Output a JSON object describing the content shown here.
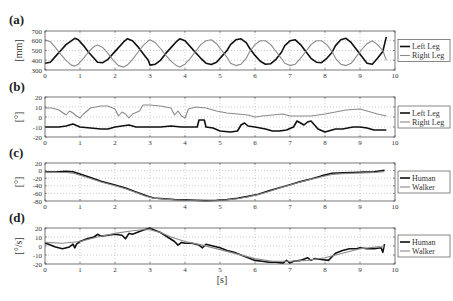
{
  "chart_data": [
    {
      "type": "line",
      "panel_label": "(a)",
      "ylabel": "[mm]",
      "xlabel": "",
      "xlim": [
        0,
        10
      ],
      "ylim": [
        300,
        700
      ],
      "xticks": [
        "0",
        "1",
        "2",
        "3",
        "4",
        "5",
        "6",
        "7",
        "8",
        "9",
        "10"
      ],
      "yticks": [
        "300",
        "400",
        "500",
        "600",
        "700"
      ],
      "ytick_values": [
        300,
        400,
        500,
        600,
        700
      ],
      "grid": true,
      "legend_position": "right",
      "series": [
        {
          "name": "Left Leg",
          "color": "#111111",
          "x": [
            0,
            0.15,
            0.3,
            0.45,
            0.6,
            0.75,
            0.85,
            0.95,
            1.1,
            1.25,
            1.4,
            1.5,
            1.65,
            1.8,
            1.95,
            2.1,
            2.25,
            2.35,
            2.5,
            2.65,
            2.8,
            2.95,
            3.0,
            3.15,
            3.3,
            3.45,
            3.6,
            3.75,
            3.85,
            4.0,
            4.15,
            4.3,
            4.45,
            4.6,
            4.75,
            4.9,
            5.05,
            5.2,
            5.3,
            5.45,
            5.6,
            5.75,
            5.85,
            6.0,
            6.15,
            6.3,
            6.45,
            6.6,
            6.75,
            6.85,
            7.0,
            7.15,
            7.3,
            7.45,
            7.6,
            7.75,
            7.9,
            8.05,
            8.2,
            8.3,
            8.45,
            8.6,
            8.75,
            8.9,
            9.05,
            9.2,
            9.35,
            9.5,
            9.65,
            9.75
          ],
          "y": [
            370,
            380,
            440,
            500,
            560,
            600,
            625,
            610,
            550,
            480,
            420,
            380,
            375,
            410,
            470,
            530,
            590,
            620,
            600,
            540,
            470,
            400,
            350,
            360,
            400,
            470,
            530,
            590,
            620,
            600,
            540,
            480,
            420,
            370,
            355,
            380,
            440,
            500,
            560,
            610,
            620,
            580,
            520,
            450,
            390,
            360,
            365,
            410,
            480,
            550,
            600,
            610,
            560,
            490,
            420,
            380,
            375,
            420,
            480,
            550,
            610,
            625,
            580,
            510,
            440,
            370,
            360,
            420,
            490,
            640
          ]
        },
        {
          "name": "Right Leg",
          "color": "#8a8a8a",
          "x": [
            0,
            0.15,
            0.3,
            0.45,
            0.6,
            0.75,
            0.85,
            0.95,
            1.1,
            1.25,
            1.4,
            1.5,
            1.65,
            1.8,
            1.95,
            2.1,
            2.25,
            2.35,
            2.5,
            2.65,
            2.8,
            2.95,
            3.0,
            3.15,
            3.3,
            3.45,
            3.6,
            3.75,
            3.85,
            4.0,
            4.15,
            4.3,
            4.45,
            4.6,
            4.75,
            4.9,
            5.05,
            5.2,
            5.3,
            5.45,
            5.6,
            5.75,
            5.85,
            6.0,
            6.15,
            6.3,
            6.45,
            6.6,
            6.75,
            6.85,
            7.0,
            7.15,
            7.3,
            7.45,
            7.6,
            7.75,
            7.9,
            8.05,
            8.2,
            8.3,
            8.45,
            8.6,
            8.75,
            8.9,
            9.05,
            9.2,
            9.35,
            9.5,
            9.65,
            9.75
          ],
          "y": [
            610,
            590,
            530,
            460,
            400,
            350,
            340,
            360,
            420,
            490,
            540,
            555,
            530,
            470,
            400,
            345,
            330,
            350,
            410,
            480,
            550,
            600,
            610,
            580,
            520,
            450,
            390,
            345,
            330,
            360,
            420,
            490,
            560,
            600,
            610,
            570,
            500,
            430,
            370,
            345,
            360,
            420,
            490,
            560,
            600,
            600,
            560,
            490,
            420,
            370,
            345,
            360,
            420,
            490,
            560,
            600,
            600,
            560,
            490,
            420,
            360,
            345,
            370,
            440,
            510,
            570,
            600,
            560,
            500,
            400
          ]
        }
      ]
    },
    {
      "type": "line",
      "panel_label": "(b)",
      "ylabel": "[°]",
      "xlabel": "",
      "xlim": [
        0,
        10
      ],
      "ylim": [
        -20,
        20
      ],
      "xticks": [
        "0",
        "1",
        "2",
        "3",
        "4",
        "5",
        "6",
        "7",
        "8",
        "9",
        "10"
      ],
      "yticks": [
        "-20",
        "-10",
        "0",
        "10",
        "20"
      ],
      "ytick_values": [
        -20,
        -10,
        0,
        10,
        20
      ],
      "grid": true,
      "legend_position": "right",
      "series": [
        {
          "name": "Left Leg",
          "color": "#111111",
          "x": [
            0,
            0.4,
            0.6,
            0.8,
            1.0,
            1.3,
            1.6,
            1.8,
            2.0,
            2.2,
            2.4,
            2.6,
            2.8,
            3.0,
            3.3,
            3.6,
            3.9,
            4.2,
            4.35,
            4.4,
            4.55,
            4.6,
            4.8,
            5.0,
            5.3,
            5.5,
            5.6,
            5.7,
            5.8,
            6.0,
            6.3,
            6.5,
            6.7,
            6.9,
            7.1,
            7.2,
            7.3,
            7.4,
            7.5,
            7.6,
            7.7,
            7.8,
            8.0,
            8.1,
            8.3,
            8.5,
            8.8,
            9.0,
            9.2,
            9.4,
            9.6,
            9.75
          ],
          "y": [
            -10,
            -10,
            -9,
            -7,
            -10,
            -11,
            -12,
            -12,
            -10,
            -9,
            -8,
            -10,
            -10,
            -10,
            -10,
            -9,
            -10,
            -10,
            -10,
            -3,
            -3,
            -10,
            -11,
            -14,
            -15,
            -14,
            -8,
            -6,
            -9,
            -10,
            -12,
            -14,
            -14,
            -13,
            -10,
            -4,
            -6,
            -8,
            -5,
            -4,
            -8,
            -12,
            -15,
            -14,
            -12,
            -12,
            -10,
            -10,
            -11,
            -13,
            -13,
            -13
          ]
        },
        {
          "name": "Right Leg",
          "color": "#8a8a8a",
          "x": [
            0,
            0.2,
            0.4,
            0.6,
            0.7,
            0.8,
            0.9,
            1.0,
            1.1,
            1.3,
            1.6,
            1.8,
            2.0,
            2.1,
            2.2,
            2.3,
            2.4,
            2.5,
            2.7,
            2.8,
            3.0,
            3.3,
            3.6,
            3.7,
            3.8,
            3.9,
            4.0,
            4.1,
            4.3,
            4.6,
            4.9,
            5.2,
            5.5,
            5.8,
            6.0,
            6.2,
            6.5,
            6.8,
            7.0,
            7.3,
            7.6,
            8.0,
            8.3,
            8.6,
            9.0,
            9.2,
            9.5,
            9.75
          ],
          "y": [
            9,
            9,
            7,
            2,
            6,
            4,
            1,
            -1,
            3,
            9,
            11,
            11,
            8,
            1,
            5,
            3,
            -1,
            3,
            6,
            12,
            12,
            11,
            9,
            2,
            6,
            1,
            -1,
            8,
            10,
            9,
            6,
            4,
            3,
            2,
            0,
            1,
            2,
            3,
            1,
            1,
            1,
            3,
            5,
            7,
            8,
            6,
            3,
            1
          ]
        }
      ]
    },
    {
      "type": "line",
      "panel_label": "(c)",
      "ylabel": "[°]",
      "xlabel": "",
      "xlim": [
        0,
        10
      ],
      "ylim": [
        -80,
        20
      ],
      "xticks": [
        "0",
        "1",
        "2",
        "3",
        "4",
        "5",
        "6",
        "7",
        "8",
        "9",
        "10"
      ],
      "yticks": [
        "-80",
        "-60",
        "-40",
        "-20",
        "0",
        "20"
      ],
      "ytick_values": [
        -80,
        -60,
        -40,
        -20,
        0,
        20
      ],
      "grid": true,
      "legend_position": "right",
      "series": [
        {
          "name": "Human",
          "color": "#111111",
          "x": [
            0,
            0.3,
            0.6,
            0.8,
            1.0,
            1.3,
            1.6,
            2.0,
            2.3,
            2.6,
            2.9,
            3.1,
            3.4,
            3.7,
            4.0,
            4.3,
            4.6,
            4.9,
            5.2,
            5.5,
            5.8,
            6.1,
            6.4,
            6.7,
            7.0,
            7.3,
            7.6,
            7.9,
            8.2,
            8.5,
            8.8,
            9.1,
            9.4,
            9.7
          ],
          "y": [
            -3,
            -4,
            -2,
            -3,
            -9,
            -18,
            -28,
            -38,
            -46,
            -56,
            -66,
            -72,
            -74,
            -76,
            -77,
            -78,
            -79,
            -78,
            -76,
            -73,
            -68,
            -62,
            -53,
            -45,
            -37,
            -29,
            -22,
            -14,
            -7,
            -6,
            -5,
            -4,
            -3,
            1
          ]
        },
        {
          "name": "Walker",
          "color": "#8a8a8a",
          "x": [
            0,
            0.3,
            0.6,
            0.8,
            1.0,
            1.3,
            1.6,
            2.0,
            2.3,
            2.6,
            2.9,
            3.1,
            3.4,
            3.7,
            4.0,
            4.3,
            4.6,
            4.9,
            5.2,
            5.5,
            5.8,
            6.1,
            6.4,
            6.7,
            7.0,
            7.3,
            7.6,
            7.9,
            8.2,
            8.5,
            8.8,
            9.1,
            9.4,
            9.7
          ],
          "y": [
            -4,
            -5,
            -5,
            -7,
            -12,
            -21,
            -30,
            -40,
            -48,
            -58,
            -68,
            -73,
            -75,
            -77,
            -78,
            -79,
            -80,
            -79,
            -77,
            -74,
            -69,
            -63,
            -55,
            -46,
            -38,
            -30,
            -23,
            -16,
            -10,
            -8,
            -7,
            -6,
            -5,
            -3
          ]
        }
      ]
    },
    {
      "type": "line",
      "panel_label": "(d)",
      "ylabel": "[°/s]",
      "xlabel": "[s]",
      "xlim": [
        0,
        10
      ],
      "ylim": [
        -20,
        20
      ],
      "xticks": [
        "0",
        "1",
        "2",
        "3",
        "4",
        "5",
        "6",
        "7",
        "8",
        "9",
        "10"
      ],
      "yticks": [
        "-20",
        "-10",
        "0",
        "10",
        "20"
      ],
      "ytick_values": [
        -20,
        -10,
        0,
        10,
        20
      ],
      "grid": true,
      "legend_position": "right",
      "series": [
        {
          "name": "Human",
          "color": "#111111",
          "x": [
            0,
            0.1,
            0.3,
            0.5,
            0.7,
            0.8,
            0.85,
            0.9,
            1.0,
            1.2,
            1.4,
            1.5,
            1.6,
            1.8,
            2.0,
            2.2,
            2.3,
            2.4,
            2.5,
            2.7,
            2.9,
            3.0,
            3.1,
            3.3,
            3.5,
            3.7,
            3.8,
            3.9,
            4.0,
            4.2,
            4.4,
            4.5,
            4.6,
            4.8,
            5.0,
            5.2,
            5.4,
            5.6,
            5.8,
            6.0,
            6.2,
            6.4,
            6.6,
            6.8,
            6.9,
            7.0,
            7.1,
            7.3,
            7.5,
            7.6,
            7.7,
            7.9,
            8.1,
            8.2,
            8.3,
            8.5,
            8.7,
            8.9,
            9.0,
            9.2,
            9.4,
            9.6,
            9.65,
            9.7
          ],
          "y": [
            3,
            2,
            -1,
            -3,
            -1,
            2,
            -2,
            2,
            5,
            8,
            10,
            13,
            11,
            12,
            13,
            12,
            8,
            14,
            13,
            16,
            19,
            20,
            18,
            15,
            10,
            5,
            1,
            4,
            3,
            3,
            1,
            -2,
            2,
            0,
            -2,
            -5,
            -7,
            -10,
            -13,
            -16,
            -17,
            -18,
            -18,
            -19,
            -16,
            -19,
            -17,
            -16,
            -13,
            -16,
            -14,
            -15,
            -16,
            -12,
            -8,
            -5,
            -3,
            -3,
            -2,
            -3,
            -3,
            -2,
            -7,
            2
          ]
        },
        {
          "name": "Walker",
          "color": "#8a8a8a",
          "x": [
            0,
            0.5,
            1.0,
            1.5,
            2.0,
            2.5,
            2.8,
            3.0,
            3.3,
            3.6,
            4.0,
            4.5,
            5.0,
            5.5,
            6.0,
            6.5,
            7.0,
            7.5,
            8.0,
            8.5,
            9.0,
            9.5,
            9.7
          ],
          "y": [
            4,
            3,
            5,
            10,
            14,
            17,
            18,
            18,
            15,
            10,
            5,
            1,
            -4,
            -9,
            -14,
            -17,
            -17,
            -16,
            -13,
            -8,
            -3,
            -1,
            -1
          ]
        }
      ]
    }
  ]
}
